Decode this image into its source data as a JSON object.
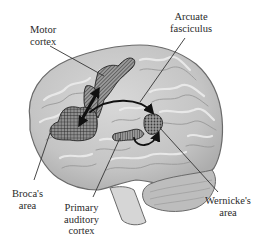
{
  "figure": {
    "type": "lateral brain diagram"
  },
  "labels": {
    "motor_cortex": [
      "Motor",
      "cortex"
    ],
    "arcuate_fasciculus": [
      "Arcuate",
      "fasciculus"
    ],
    "brocas_area": [
      "Broca's",
      "area"
    ],
    "primary_auditory_cortex": [
      "Primary",
      "auditory",
      "cortex"
    ],
    "wernickes_area": [
      "Wernicke's",
      "area"
    ]
  },
  "colors": {
    "brain_fill": "#c9c9c9",
    "brain_outline": "#6a6a6a",
    "gyri_light": "#e6e6e6",
    "gyri_dark": "#9a9a9a",
    "hatch": "#2b2b2b",
    "region_fill": "#8c8c8c",
    "leader_line": "#333333",
    "arrow": "#111111",
    "background": "#ffffff"
  }
}
